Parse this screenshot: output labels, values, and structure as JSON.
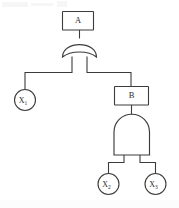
{
  "diagram": {
    "type": "fault-tree",
    "background_color": "#ffffff",
    "line_color": "#3c3c3c",
    "nodes": {
      "top_event": {
        "id": "A",
        "label": "A",
        "shape": "rectangle",
        "role": "intermediate-event"
      },
      "or_gate": {
        "id": "OR1",
        "label": "",
        "shape": "or-gate",
        "role": "gate",
        "gate_type": "OR"
      },
      "basic_1": {
        "id": "X1",
        "label": "X",
        "subscript": "1",
        "shape": "circle",
        "role": "basic-event"
      },
      "mid_event": {
        "id": "B",
        "label": "B",
        "shape": "rectangle",
        "role": "intermediate-event"
      },
      "and_gate": {
        "id": "AND1",
        "label": "",
        "shape": "and-gate",
        "role": "gate",
        "gate_type": "AND"
      },
      "basic_2": {
        "id": "X2",
        "label": "X",
        "subscript": "2",
        "shape": "circle",
        "role": "basic-event"
      },
      "basic_3": {
        "id": "X3",
        "label": "X",
        "subscript": "3",
        "shape": "circle",
        "role": "basic-event"
      }
    },
    "edges": [
      {
        "from": "A",
        "to": "OR1"
      },
      {
        "from": "OR1",
        "to": "X1"
      },
      {
        "from": "OR1",
        "to": "B"
      },
      {
        "from": "B",
        "to": "AND1"
      },
      {
        "from": "AND1",
        "to": "X2"
      },
      {
        "from": "AND1",
        "to": "X3"
      }
    ]
  }
}
